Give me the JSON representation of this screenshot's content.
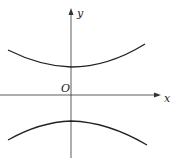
{
  "diagram": {
    "type": "hyperbola",
    "labels": {
      "x_axis": "x",
      "y_axis": "y",
      "origin": "O"
    },
    "colors": {
      "axes": "#333333",
      "curve": "#222222"
    }
  }
}
